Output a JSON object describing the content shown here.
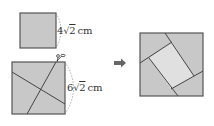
{
  "figure": {
    "small_square": {
      "side_label": "4√2cm",
      "coef": "4",
      "radicand": "2",
      "unit": "cm"
    },
    "large_square": {
      "side_label": "6√2cm",
      "coef": "6",
      "radicand": "2",
      "unit": "cm",
      "cut_icon": "scissors-icon"
    },
    "arrow_icon": "right-arrow-icon",
    "result_square": {
      "description": "large square with rotated small square inset formed by four trapezoid pieces"
    },
    "colors": {
      "fill": "#c8c8c8",
      "inner_fill": "#e0e0e0",
      "stroke": "#555555",
      "dash": "#888888",
      "arrow": "#666666"
    }
  }
}
